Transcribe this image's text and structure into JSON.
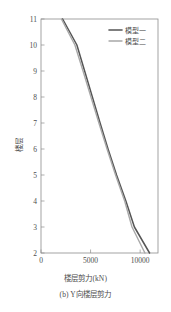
{
  "figure": {
    "caption": "(b) Y向楼层剪力",
    "xaxis_title": "楼层剪力(kN)",
    "yaxis_title": "楼层"
  },
  "chart_data": {
    "type": "line",
    "title": "",
    "subtitle": "(b) Y向楼层剪力",
    "xlabel": "楼层剪力(kN)",
    "ylabel": "楼层",
    "xlim": [
      0,
      11800
    ],
    "ylim": [
      2,
      11
    ],
    "xticks": [
      0,
      5000,
      10000
    ],
    "xtick_labels": [
      "0",
      "5000",
      "10000"
    ],
    "yticks": [
      2,
      3,
      4,
      5,
      6,
      7,
      8,
      9,
      10,
      11
    ],
    "ytick_labels": [
      "2",
      "3",
      "4",
      "5",
      "6",
      "7",
      "8",
      "9",
      "10",
      "11"
    ],
    "grid": false,
    "legend_position": "top-right",
    "orientation": "x=shear, y=storey",
    "series": [
      {
        "name": "模型一",
        "color": "#555555",
        "width": 1.5,
        "x": [
          2180,
          3620,
          4400,
          5180,
          5960,
          6760,
          7620,
          8560,
          9420,
          10950
        ],
        "y": [
          11,
          10,
          9,
          8,
          7,
          6,
          5,
          4,
          3,
          2
        ]
      },
      {
        "name": "模型二",
        "color": "#a8a8a8",
        "width": 1.4,
        "x": [
          2060,
          3420,
          4240,
          5040,
          5840,
          6660,
          7520,
          8440,
          9180,
          10480
        ],
        "y": [
          11,
          10,
          9,
          8,
          7,
          6,
          5,
          4,
          3,
          2
        ]
      }
    ]
  },
  "legend": {
    "items": [
      {
        "label": "模型一",
        "color": "#555555"
      },
      {
        "label": "模型二",
        "color": "#a8a8a8"
      }
    ]
  }
}
